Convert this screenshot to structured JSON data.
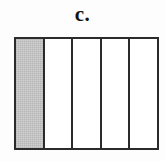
{
  "figure": {
    "label": "c.",
    "colors": {
      "outline": "#2b2b2b",
      "shaded_fill": "#c9c9c9",
      "empty_fill": "#ffffff",
      "background": "#fdfdfd",
      "label_color": "#141414"
    },
    "bar": {
      "total_parts": 5,
      "shaded_parts": 1,
      "cells": [
        {
          "index": 1,
          "state": "shaded"
        },
        {
          "index": 2,
          "state": "empty"
        },
        {
          "index": 3,
          "state": "empty"
        },
        {
          "index": 4,
          "state": "empty"
        },
        {
          "index": 5,
          "state": "empty"
        }
      ]
    }
  }
}
